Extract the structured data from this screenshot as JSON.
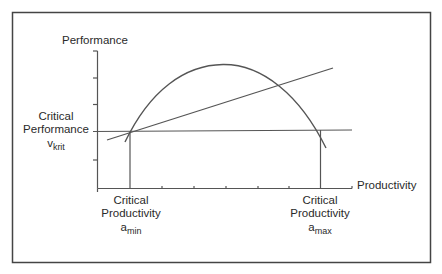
{
  "diagram": {
    "y_axis_label": "Performance",
    "x_axis_label": "Productivity",
    "critical_performance": {
      "line1": "Critical",
      "line2": "Performance",
      "symbol": "v",
      "subscript": "krit"
    },
    "critical_productivity_min": {
      "line1": "Critical",
      "line2": "Productivity",
      "symbol": "a",
      "subscript": "min"
    },
    "critical_productivity_max": {
      "line1": "Critical",
      "line2": "Productivity",
      "symbol": "a",
      "subscript": "max"
    },
    "colors": {
      "line": "#555555",
      "frame": "#444444",
      "text": "#2a2a2a"
    },
    "elements": [
      "frame",
      "y-axis",
      "x-axis",
      "performance-curve (parabola)",
      "linear-line (rising)",
      "critical-performance-line (horizontal)",
      "a-min-drop-line (vertical)",
      "a-max-drop-line (vertical)"
    ]
  }
}
